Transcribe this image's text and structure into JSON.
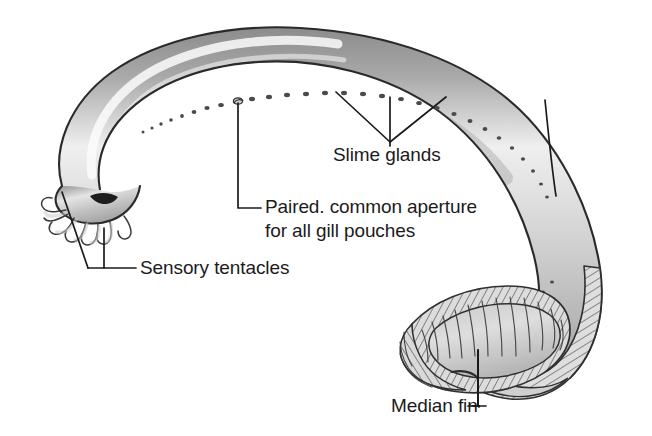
{
  "figure": {
    "background_color": "#ffffff",
    "line_color": "#1b1b1b",
    "body_fill_light": "#e9e9e9",
    "body_fill_mid": "#b9b9b9",
    "body_fill_dark": "#8f8f8f",
    "fin_fill": "#d6d6d6"
  },
  "labels": [
    {
      "id": "slime-glands",
      "text": "Slime glands",
      "x": 333,
      "y": 161,
      "anchor": "start"
    },
    {
      "id": "paired-aperture-line1",
      "text": "Paired. common aperture",
      "x": 265,
      "y": 213,
      "anchor": "start"
    },
    {
      "id": "paired-aperture-line2",
      "text": "for all gill pouches",
      "x": 265,
      "y": 237,
      "anchor": "start"
    },
    {
      "id": "sensory-tentacles",
      "text": "Sensory tentacles",
      "x": 140,
      "y": 274,
      "anchor": "start"
    },
    {
      "id": "median-fin",
      "text": "Median fin",
      "x": 391,
      "y": 412,
      "anchor": "start"
    }
  ],
  "anatomy_parts": [
    "body-trunk",
    "head",
    "sensory-tentacles",
    "mouth",
    "slime-gland-pore-row",
    "gill-aperture",
    "median-fin",
    "tail"
  ]
}
